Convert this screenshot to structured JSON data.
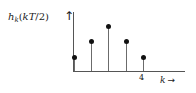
{
  "figure": {
    "y_axis": {
      "label_main": "h",
      "label_sub": "k",
      "label_arg_open": "(",
      "label_arg": "kT",
      "label_slash": "/",
      "label_denom": "2",
      "label_arg_close": ")",
      "label_full": "h_k(kT/2)",
      "arrow_glyph": "↑"
    },
    "x_axis": {
      "name": "k",
      "arrow_glyph": "→",
      "ticks": [
        {
          "label": "4",
          "k": 4
        }
      ]
    },
    "colors": {
      "axis": "#555555",
      "stem": "#6b6b6b",
      "marker": "#111111",
      "text": "#1a1a1a",
      "background": "#ffffff"
    }
  },
  "chart_data": {
    "type": "stem",
    "title": "",
    "xlabel": "k",
    "ylabel": "h_k(kT/2)",
    "grid": false,
    "legend": null,
    "x": [
      0,
      1,
      2,
      3,
      4
    ],
    "values": [
      0.23,
      0.52,
      0.78,
      0.52,
      0.23
    ],
    "categories": [
      "0",
      "1",
      "2",
      "3",
      "4"
    ],
    "xlim": [
      0,
      6.5
    ],
    "ylim": [
      0,
      1
    ],
    "tick_labels_shown": [
      "4"
    ],
    "annotations": []
  }
}
